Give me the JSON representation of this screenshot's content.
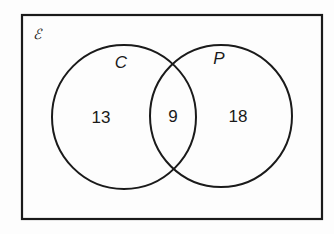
{
  "diagram": {
    "type": "venn",
    "universal_symbol": "ℰ",
    "sets": [
      {
        "name": "C",
        "only_count": "13"
      },
      {
        "name": "P",
        "only_count": "18"
      }
    ],
    "intersection_count": "9",
    "colors": {
      "stroke": "#1a1a1a",
      "background": "#fdfdfd"
    }
  }
}
